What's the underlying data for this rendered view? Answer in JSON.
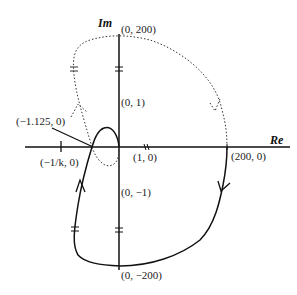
{
  "diagram": {
    "title": "",
    "type": "nyquist-plot",
    "axes": {
      "real_label": "Re",
      "imag_label": "Im"
    },
    "labels": {
      "top": "(0, 200)",
      "pos_imag_small": "(0, 1)",
      "critical": "(−1.125, 0)",
      "minus_one_over_k": "(−1/k, 0)",
      "one_zero": "(1, 0)",
      "neg_imag_small": "(0, −1)",
      "right": "(200, 0)",
      "bottom": "(0, −200)"
    },
    "curves": [
      {
        "name": "positive-frequency-branch",
        "style": "solid"
      },
      {
        "name": "negative-frequency-branch",
        "style": "dotted"
      }
    ],
    "colors": {
      "stroke": "#111111",
      "background": "#ffffff"
    }
  }
}
